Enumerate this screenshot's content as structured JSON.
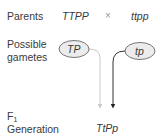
{
  "rows": {
    "parents": {
      "label": "Parents",
      "parent1": "TTPP",
      "cross_symbol": "×",
      "parent2": "ttpp"
    },
    "gametes": {
      "label_line1": "Possible",
      "label_line2": "gametes",
      "gamete1": "TP",
      "gamete2": "tp"
    },
    "f1": {
      "label_main": "F",
      "label_sub": "1",
      "label_line2": "Generation",
      "offspring": "TtPp"
    }
  },
  "colors": {
    "oval_fill": "#ececec",
    "oval_stroke": "#555555",
    "line_from_parent1": "#c8c8c8",
    "line_from_parent2": "#333333"
  }
}
